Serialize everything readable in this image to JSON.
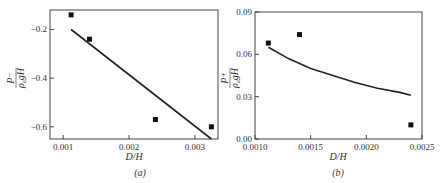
{
  "chart_data": [
    {
      "type": "scatter",
      "panel_label": "(a)",
      "xlabel": "D/H",
      "ylabel": "P⁻ / (ρ_a g H)",
      "xlim": [
        0.0008,
        0.00335
      ],
      "ylim": [
        -0.65,
        -0.12
      ],
      "xticks": [
        0.001,
        0.002,
        0.003
      ],
      "xtick_labels": [
        "0.001",
        "0.002",
        "0.003"
      ],
      "yticks": [
        -0.2,
        -0.4,
        -0.6
      ],
      "ytick_labels": [
        "-0.2",
        "-0.4",
        "-0.6"
      ],
      "grid": false,
      "series": [
        {
          "name": "measured",
          "kind": "markers",
          "marker": "square",
          "x": [
            0.00112,
            0.0014,
            0.0024,
            0.00325
          ],
          "y": [
            -0.14,
            -0.24,
            -0.57,
            -0.6
          ]
        },
        {
          "name": "fit",
          "kind": "line",
          "x": [
            0.00112,
            0.00325
          ],
          "y": [
            -0.2,
            -0.65
          ]
        }
      ]
    },
    {
      "type": "scatter",
      "panel_label": "(b)",
      "xlabel": "D/H",
      "ylabel": "P⁺ / (ρ_a g H)",
      "xlim": [
        0.001,
        0.0025
      ],
      "ylim": [
        0.0,
        0.09
      ],
      "xticks": [
        0.001,
        0.0015,
        0.002,
        0.0025
      ],
      "xtick_labels": [
        "0.0010",
        "0.0015",
        "0.0020",
        "0.0025"
      ],
      "yticks": [
        0.0,
        0.03,
        0.06,
        0.09
      ],
      "ytick_labels": [
        "0.00",
        "0.03",
        "0.06",
        "0.09"
      ],
      "grid": false,
      "series": [
        {
          "name": "measured",
          "kind": "markers",
          "marker": "square",
          "x": [
            0.00112,
            0.0014,
            0.0024
          ],
          "y": [
            0.068,
            0.074,
            0.01
          ]
        },
        {
          "name": "fit",
          "kind": "curve",
          "x": [
            0.00112,
            0.0013,
            0.0015,
            0.0017,
            0.0019,
            0.0021,
            0.0023,
            0.0024
          ],
          "y": [
            0.065,
            0.057,
            0.05,
            0.045,
            0.04,
            0.036,
            0.033,
            0.031
          ]
        }
      ]
    }
  ]
}
